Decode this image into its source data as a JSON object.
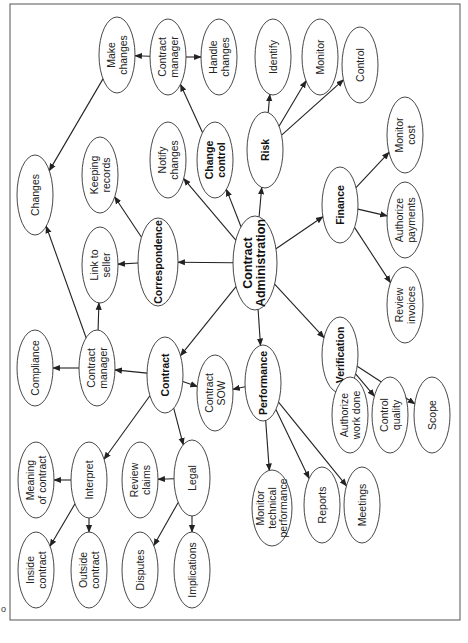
{
  "diagram": {
    "orientation": "rotated -90deg",
    "corner_mark": "o",
    "nodes": [
      {
        "id": "contract_admin",
        "label": [
          "Contract",
          "Administration"
        ],
        "bold": true,
        "cx": 255,
        "cy": 263,
        "rx": 22,
        "ry": 47
      },
      {
        "id": "correspondence",
        "label": [
          "Correspondence"
        ],
        "bold": true,
        "cx": 158,
        "cy": 262,
        "rx": 20,
        "ry": 44
      },
      {
        "id": "link_seller",
        "label": [
          "Link to",
          "seller"
        ],
        "bold": false,
        "cx": 100,
        "cy": 265,
        "rx": 18,
        "ry": 38
      },
      {
        "id": "keeping_records",
        "label": [
          "Keeping",
          "records"
        ],
        "bold": false,
        "cx": 100,
        "cy": 175,
        "rx": 18,
        "ry": 38
      },
      {
        "id": "changes",
        "label": [
          "Changes"
        ],
        "bold": false,
        "cx": 35,
        "cy": 195,
        "rx": 18,
        "ry": 40
      },
      {
        "id": "make_changes",
        "label": [
          "Make",
          "changes"
        ],
        "bold": false,
        "cx": 117,
        "cy": 55,
        "rx": 18,
        "ry": 38
      },
      {
        "id": "cm_top",
        "label": [
          "Contract",
          "manager"
        ],
        "bold": false,
        "cx": 168,
        "cy": 57,
        "rx": 18,
        "ry": 38
      },
      {
        "id": "handle_changes",
        "label": [
          "Handle",
          "changes"
        ],
        "bold": false,
        "cx": 219,
        "cy": 57,
        "rx": 18,
        "ry": 38
      },
      {
        "id": "notify_changes",
        "label": [
          "Notify",
          "changes"
        ],
        "bold": false,
        "cx": 168,
        "cy": 160,
        "rx": 18,
        "ry": 38
      },
      {
        "id": "change_control",
        "label": [
          "Change",
          "control"
        ],
        "bold": true,
        "cx": 215,
        "cy": 160,
        "rx": 18,
        "ry": 38
      },
      {
        "id": "risk",
        "label": [
          "Risk"
        ],
        "bold": true,
        "cx": 265,
        "cy": 150,
        "rx": 18,
        "ry": 38
      },
      {
        "id": "identify",
        "label": [
          "Identify"
        ],
        "bold": false,
        "cx": 273,
        "cy": 57,
        "rx": 18,
        "ry": 38
      },
      {
        "id": "monitor",
        "label": [
          "Monitor"
        ],
        "bold": false,
        "cx": 320,
        "cy": 57,
        "rx": 18,
        "ry": 38
      },
      {
        "id": "control",
        "label": [
          "Control"
        ],
        "bold": false,
        "cx": 360,
        "cy": 65,
        "rx": 18,
        "ry": 38
      },
      {
        "id": "finance",
        "label": [
          "Finance"
        ],
        "bold": true,
        "cx": 340,
        "cy": 205,
        "rx": 18,
        "ry": 38
      },
      {
        "id": "monitor_cost",
        "label": [
          "Monitor",
          "cost"
        ],
        "bold": false,
        "cx": 405,
        "cy": 135,
        "rx": 18,
        "ry": 38
      },
      {
        "id": "authorize_payments",
        "label": [
          "Authorize",
          "payments"
        ],
        "bold": false,
        "cx": 405,
        "cy": 220,
        "rx": 18,
        "ry": 38
      },
      {
        "id": "review_invoices",
        "label": [
          "Review",
          "invoices"
        ],
        "bold": false,
        "cx": 405,
        "cy": 305,
        "rx": 18,
        "ry": 38
      },
      {
        "id": "verification",
        "label": [
          "Verification"
        ],
        "bold": true,
        "cx": 340,
        "cy": 355,
        "rx": 18,
        "ry": 38
      },
      {
        "id": "authorize_work",
        "label": [
          "Authorize",
          "work done"
        ],
        "bold": false,
        "cx": 350,
        "cy": 415,
        "rx": 18,
        "ry": 38
      },
      {
        "id": "control_quality",
        "label": [
          "Control",
          "quality"
        ],
        "bold": false,
        "cx": 390,
        "cy": 415,
        "rx": 18,
        "ry": 38
      },
      {
        "id": "scope",
        "label": [
          "Scope"
        ],
        "bold": false,
        "cx": 432,
        "cy": 415,
        "rx": 18,
        "ry": 38
      },
      {
        "id": "performance",
        "label": [
          "Performance"
        ],
        "bold": true,
        "cx": 263,
        "cy": 383,
        "rx": 18,
        "ry": 38
      },
      {
        "id": "contract_sow",
        "label": [
          "Contract",
          "SOW"
        ],
        "bold": false,
        "cx": 215,
        "cy": 393,
        "rx": 18,
        "ry": 38
      },
      {
        "id": "contract",
        "label": [
          "Contract"
        ],
        "bold": true,
        "cx": 165,
        "cy": 375,
        "rx": 18,
        "ry": 38
      },
      {
        "id": "cm_left",
        "label": [
          "Contract",
          "manager"
        ],
        "bold": false,
        "cx": 97,
        "cy": 368,
        "rx": 18,
        "ry": 38
      },
      {
        "id": "compliance",
        "label": [
          "Compliance"
        ],
        "bold": false,
        "cx": 35,
        "cy": 368,
        "rx": 18,
        "ry": 38
      },
      {
        "id": "interpret",
        "label": [
          "Interpret"
        ],
        "bold": false,
        "cx": 89,
        "cy": 480,
        "rx": 18,
        "ry": 38
      },
      {
        "id": "meaning_contract",
        "label": [
          "Meaning",
          "of contract"
        ],
        "bold": false,
        "cx": 36,
        "cy": 480,
        "rx": 18,
        "ry": 38
      },
      {
        "id": "review_claims",
        "label": [
          "Review",
          "claims"
        ],
        "bold": false,
        "cx": 140,
        "cy": 480,
        "rx": 18,
        "ry": 38
      },
      {
        "id": "legal",
        "label": [
          "Legal"
        ],
        "bold": false,
        "cx": 192,
        "cy": 478,
        "rx": 18,
        "ry": 38
      },
      {
        "id": "inside_contract",
        "label": [
          "Inside",
          "contract"
        ],
        "bold": false,
        "cx": 36,
        "cy": 570,
        "rx": 18,
        "ry": 38
      },
      {
        "id": "outside_contract",
        "label": [
          "Outside",
          "contract"
        ],
        "bold": false,
        "cx": 89,
        "cy": 570,
        "rx": 18,
        "ry": 38
      },
      {
        "id": "disputes",
        "label": [
          "Disputes"
        ],
        "bold": false,
        "cx": 140,
        "cy": 570,
        "rx": 18,
        "ry": 38
      },
      {
        "id": "implications",
        "label": [
          "Implications"
        ],
        "bold": false,
        "cx": 192,
        "cy": 570,
        "rx": 18,
        "ry": 38
      },
      {
        "id": "monitor_tech",
        "label": [
          "Monitor",
          "technical",
          "performance"
        ],
        "bold": false,
        "cx": 272,
        "cy": 508,
        "rx": 20,
        "ry": 38
      },
      {
        "id": "reports",
        "label": [
          "Reports"
        ],
        "bold": false,
        "cx": 322,
        "cy": 505,
        "rx": 18,
        "ry": 38
      },
      {
        "id": "meetings",
        "label": [
          "Meetings"
        ],
        "bold": false,
        "cx": 362,
        "cy": 505,
        "rx": 18,
        "ry": 38
      }
    ],
    "edges": [
      {
        "from": "contract_admin",
        "to": "correspondence"
      },
      {
        "from": "contract_admin",
        "to": "notify_changes"
      },
      {
        "from": "contract_admin",
        "to": "change_control"
      },
      {
        "from": "contract_admin",
        "to": "risk"
      },
      {
        "from": "contract_admin",
        "to": "finance"
      },
      {
        "from": "contract_admin",
        "to": "verification"
      },
      {
        "from": "contract_admin",
        "to": "performance"
      },
      {
        "from": "contract_admin",
        "to": "contract"
      },
      {
        "from": "correspondence",
        "to": "link_seller"
      },
      {
        "from": "correspondence",
        "to": "keeping_records"
      },
      {
        "from": "change_control",
        "to": "cm_top"
      },
      {
        "from": "cm_top",
        "to": "make_changes"
      },
      {
        "from": "cm_top",
        "to": "handle_changes"
      },
      {
        "from": "make_changes",
        "to": "changes"
      },
      {
        "from": "risk",
        "to": "identify"
      },
      {
        "from": "risk",
        "to": "monitor"
      },
      {
        "from": "risk",
        "to": "control"
      },
      {
        "from": "finance",
        "to": "monitor_cost"
      },
      {
        "from": "finance",
        "to": "authorize_payments"
      },
      {
        "from": "finance",
        "to": "review_invoices"
      },
      {
        "from": "verification",
        "to": "authorize_work"
      },
      {
        "from": "verification",
        "to": "control_quality"
      },
      {
        "from": "verification",
        "to": "scope"
      },
      {
        "from": "performance",
        "to": "contract_sow"
      },
      {
        "from": "performance",
        "to": "monitor_tech"
      },
      {
        "from": "performance",
        "to": "reports"
      },
      {
        "from": "performance",
        "to": "meetings"
      },
      {
        "from": "contract",
        "to": "contract_sow"
      },
      {
        "from": "contract",
        "to": "cm_left"
      },
      {
        "from": "contract",
        "to": "interpret"
      },
      {
        "from": "contract",
        "to": "legal"
      },
      {
        "from": "cm_left",
        "to": "compliance"
      },
      {
        "from": "cm_left",
        "to": "link_seller"
      },
      {
        "from": "cm_left",
        "to": "changes"
      },
      {
        "from": "interpret",
        "to": "meaning_contract"
      },
      {
        "from": "interpret",
        "to": "inside_contract"
      },
      {
        "from": "interpret",
        "to": "outside_contract"
      },
      {
        "from": "legal",
        "to": "review_claims"
      },
      {
        "from": "legal",
        "to": "disputes"
      },
      {
        "from": "legal",
        "to": "implications"
      }
    ],
    "colors": {
      "stroke": "#333333",
      "text": "#222222",
      "background": "#ffffff",
      "frame": "#555555"
    }
  }
}
